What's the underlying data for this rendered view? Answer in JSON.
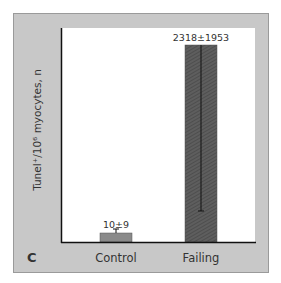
{
  "chart_data": {
    "type": "bar",
    "panel_label": "C",
    "title": "",
    "xlabel": "",
    "ylabel": "Tunel⁺/10⁶ myocytes, n",
    "categories": [
      "Control",
      "Failing"
    ],
    "values": [
      10,
      2318
    ],
    "errors": [
      9,
      1953
    ],
    "data_labels": [
      "10±9",
      "2318±1953"
    ],
    "ylim": [
      0,
      2500
    ],
    "y_ticks": [],
    "grid": false,
    "legend": "none",
    "colors": {
      "frame": "#c8c8c8",
      "plot_bg": "#ffffff",
      "control_bar": "#8a8a8a",
      "failing_bar": "#5a5a5a",
      "axis": "#111111"
    }
  }
}
